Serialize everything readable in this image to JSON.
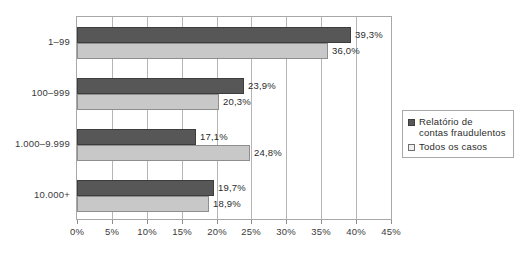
{
  "chart_data": {
    "type": "bar",
    "orientation": "horizontal",
    "title": "",
    "xlabel": "",
    "ylabel": "",
    "categories": [
      "1–99",
      "100–999",
      "1.000–9.999",
      "10.000+"
    ],
    "series": [
      {
        "name": "Relatório de\ncontas fraudulentos",
        "color": "#575757",
        "values": [
          39.3,
          23.9,
          17.1,
          19.7
        ],
        "labels": [
          "39,3%",
          "23,9%",
          "17,1%",
          "19,7%"
        ]
      },
      {
        "name": "Todos os casos",
        "color": "#c8c8c8",
        "values": [
          36.0,
          20.3,
          24.8,
          18.9
        ],
        "labels": [
          "36,0%",
          "20,3%",
          "24,8%",
          "18,9%"
        ]
      }
    ],
    "xlim": [
      0,
      45
    ],
    "xticks": [
      0,
      5,
      10,
      15,
      20,
      25,
      30,
      35,
      40,
      45
    ],
    "xtick_labels": [
      "0%",
      "5%",
      "10%",
      "15%",
      "20%",
      "25%",
      "30%",
      "35%",
      "40%",
      "45%"
    ],
    "grid": true,
    "legend_position": "right"
  },
  "legend": {
    "items": [
      {
        "label": "Relatório de\ncontas fraudulentos"
      },
      {
        "label": "Todos os casos"
      }
    ]
  },
  "colors": {
    "series_dark": "#575757",
    "series_light": "#c8c8c8",
    "axis": "#a8a8a8",
    "grid": "#b5b5b5",
    "text": "#2b2b2b",
    "background": "#ffffff"
  }
}
